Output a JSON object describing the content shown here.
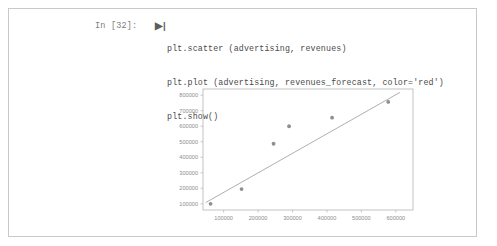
{
  "notebook": {
    "prompt_label": "In [32]:",
    "run_marker": "▶|",
    "code_lines": [
      "plt.scatter (advertising, revenues)",
      "plt.plot (advertising, revenues_forecast, color='red')",
      "plt.show()"
    ]
  },
  "chart_data": {
    "type": "scatter",
    "title": "",
    "xlabel": "",
    "ylabel": "",
    "xlim": [
      40000,
      650000
    ],
    "ylim": [
      60000,
      840000
    ],
    "xticks": [
      100000,
      200000,
      300000,
      400000,
      500000,
      600000
    ],
    "xticklabels": [
      "100000",
      "200000",
      "300000",
      "400000",
      "500000",
      "600000"
    ],
    "yticks": [
      100000,
      200000,
      300000,
      400000,
      500000,
      600000,
      700000,
      800000
    ],
    "yticklabels": [
      "100000",
      "200000",
      "300000",
      "400000",
      "500000",
      "600000",
      "700000",
      "800000"
    ],
    "grid": false,
    "legend": false,
    "series": [
      {
        "name": "revenues",
        "kind": "scatter",
        "color": "#8d8f96",
        "x": [
          62000,
          152000,
          245000,
          290000,
          415000,
          578000
        ],
        "y": [
          100000,
          195000,
          487000,
          600000,
          655000,
          757000
        ]
      },
      {
        "name": "revenues_forecast",
        "kind": "line",
        "color": "#a9a4a4",
        "x": [
          48000,
          612000
        ],
        "y": [
          108000,
          818000
        ]
      }
    ]
  }
}
